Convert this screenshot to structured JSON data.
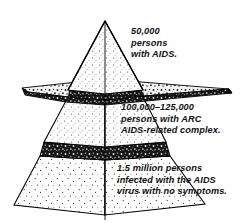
{
  "diagram": {
    "type": "layered-pyramid",
    "style": {
      "stroke": "#000000",
      "fill_light": "#ffffff",
      "fill_band": "#1a1a1a",
      "stipple": "#333333"
    },
    "tiers": [
      {
        "id": "tier-top",
        "name": "aids-tier",
        "lines": [
          "50,000",
          "persons",
          "with AIDS."
        ],
        "count": "50,000",
        "description": "persons with AIDS."
      },
      {
        "id": "tier-middle",
        "name": "arc-tier",
        "lines": [
          "100,000–125,000",
          "persons with ARC",
          "AIDS-related complex."
        ],
        "count": "100,000–125,000",
        "description": "persons with ARC AIDS-related complex."
      },
      {
        "id": "tier-bottom",
        "name": "asymptomatic-tier",
        "lines": [
          "1.5 million persons",
          "infected with the AIDS",
          "virus with no symptoms."
        ],
        "count": "1.5 million",
        "description": "persons infected with the AIDS virus with no symptoms."
      }
    ]
  }
}
